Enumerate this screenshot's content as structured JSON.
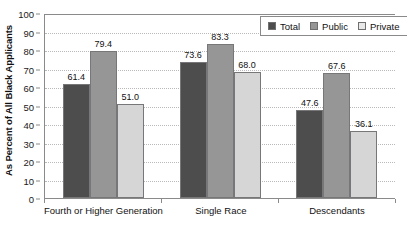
{
  "chart_data": {
    "type": "bar",
    "title": "",
    "subtitle": "",
    "xlabel": "",
    "ylabel": "As Percent of All Black Applicants",
    "ylim": [
      0,
      100
    ],
    "ytick_step": 10,
    "yticks": [
      "100",
      "90",
      "80",
      "70",
      "60",
      "50",
      "40",
      "30",
      "20",
      "10",
      "0"
    ],
    "grid": "horizontal-dotted",
    "legend_position": "top-right",
    "categories": [
      "Fourth or Higher Generation",
      "Single Race",
      "Descendants"
    ],
    "series": [
      {
        "name": "Total",
        "color": "#4d4d4d",
        "values": [
          61.4,
          73.6,
          47.6
        ],
        "labels": [
          "61.4",
          "73.6",
          "47.6"
        ]
      },
      {
        "name": "Public",
        "color": "#969696",
        "values": [
          79.4,
          83.3,
          67.6
        ],
        "labels": [
          "79.4",
          "83.3",
          "67.6"
        ]
      },
      {
        "name": "Private",
        "color": "#d6d6d6",
        "values": [
          51.0,
          68.0,
          36.1
        ],
        "labels": [
          "51.0",
          "68.0",
          "36.1"
        ]
      }
    ]
  },
  "legend": {
    "items": [
      {
        "label": "Total",
        "swatch": "total"
      },
      {
        "label": "Public",
        "swatch": "public"
      },
      {
        "label": "Private",
        "swatch": "private"
      }
    ]
  }
}
